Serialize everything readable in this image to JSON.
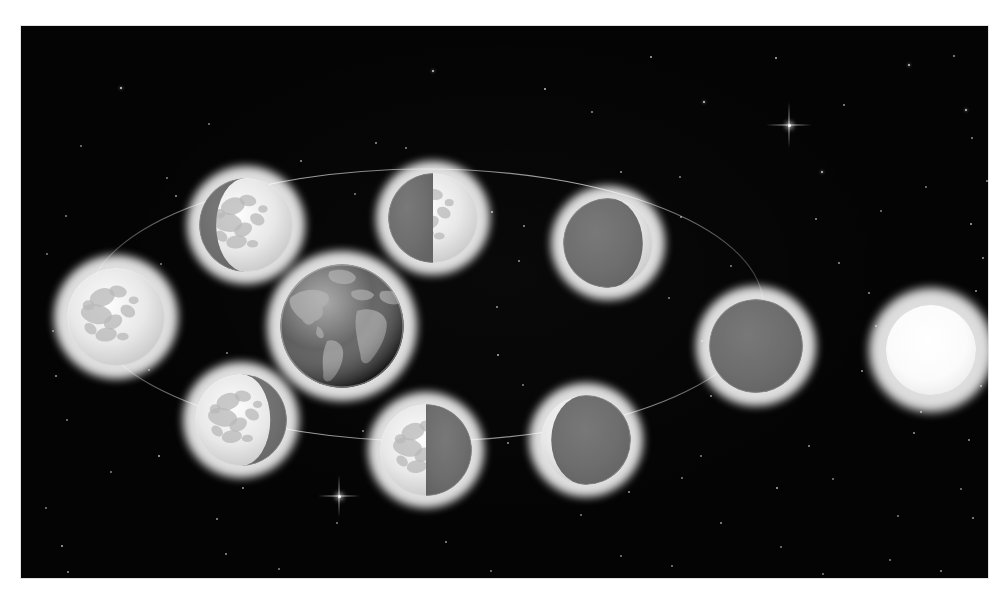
{
  "scene": {
    "title": "Phases of the Moon",
    "description": "Diagram of the lunar phases: the Moon orbiting the Earth with sunlight arriving from the right, shown against a starfield.",
    "canvas": {
      "width": 1003,
      "height": 599
    },
    "plate": {
      "x": 21,
      "y": 26,
      "width": 967,
      "height": 552
    },
    "colors": {
      "sky": "#040404",
      "page": "#ffffff",
      "moon_lit": "#e8e8e8",
      "moon_dark": "#6f6f6f",
      "moon_glow": "#cfcfcf",
      "earth_ocean": "#5a5a5a",
      "earth_land": "#9a9a9a",
      "earth_glow": "#b8b8b8",
      "sun": "#ffffff",
      "sun_glow": "#f2f2f2",
      "orbit_line": "#9a9a9a",
      "star": "#ffffff"
    },
    "orbit": {
      "label": "lunar-orbit-ellipse",
      "center_x": 404,
      "center_y": 279,
      "radius_x": 338,
      "radius_y": 136,
      "stroke_width": 1.1,
      "opacity": 0.55
    }
  },
  "bodies": [
    {
      "name": "full-moon",
      "label": "Full Moon",
      "phase": "full",
      "kind": "moon",
      "x": 95,
      "y": 291,
      "radius": 49,
      "glow_radius": 62,
      "illumination_percent": 100,
      "lit_side": "all"
    },
    {
      "name": "waning-gibbous-moon",
      "label": "Waning Gibbous",
      "phase": "waning-gibbous",
      "kind": "moon",
      "x": 225,
      "y": 199,
      "radius": 47,
      "glow_radius": 59,
      "illumination_percent": 72,
      "lit_side": "right"
    },
    {
      "name": "last-quarter-moon",
      "label": "Last Quarter",
      "phase": "last-quarter",
      "kind": "moon",
      "x": 412,
      "y": 192,
      "radius": 45,
      "glow_radius": 57,
      "illumination_percent": 50,
      "lit_side": "right"
    },
    {
      "name": "waning-crescent-moon",
      "label": "Waning Crescent",
      "phase": "waning-crescent",
      "kind": "moon",
      "x": 587,
      "y": 217,
      "radius": 45,
      "glow_radius": 57,
      "illumination_percent": 22,
      "lit_side": "right"
    },
    {
      "name": "new-moon",
      "label": "New Moon",
      "phase": "new",
      "kind": "moon",
      "x": 735,
      "y": 320,
      "radius": 47,
      "glow_radius": 60,
      "illumination_percent": 0,
      "lit_side": "none"
    },
    {
      "name": "waxing-crescent-moon",
      "label": "Waxing Crescent",
      "phase": "waxing-crescent",
      "kind": "moon",
      "x": 565,
      "y": 414,
      "radius": 45,
      "glow_radius": 57,
      "illumination_percent": 22,
      "lit_side": "left"
    },
    {
      "name": "first-quarter-moon",
      "label": "First Quarter",
      "phase": "first-quarter",
      "kind": "moon",
      "x": 405,
      "y": 424,
      "radius": 46,
      "glow_radius": 58,
      "illumination_percent": 50,
      "lit_side": "left"
    },
    {
      "name": "waxing-gibbous-moon",
      "label": "Waxing Gibbous",
      "phase": "waxing-gibbous",
      "kind": "moon",
      "x": 220,
      "y": 394,
      "radius": 46,
      "glow_radius": 58,
      "illumination_percent": 72,
      "lit_side": "left"
    },
    {
      "name": "earth",
      "label": "Earth",
      "phase": "earth",
      "kind": "earth",
      "x": 321,
      "y": 300,
      "radius": 62,
      "glow_radius": 75,
      "illumination_percent": 100,
      "lit_side": "right"
    },
    {
      "name": "sun",
      "label": "Sun",
      "phase": "sun",
      "kind": "sun",
      "x": 910,
      "y": 324,
      "radius": 45,
      "glow_radius": 62,
      "illumination_percent": 100,
      "lit_side": "all"
    }
  ],
  "sparkles": [
    {
      "name": "sparkle-upper-right",
      "x": 768,
      "y": 99,
      "size": 46
    },
    {
      "name": "sparkle-lower-left",
      "x": 318,
      "y": 470,
      "size": 42
    }
  ],
  "stars": [
    {
      "x": 100,
      "y": 62,
      "r": 1.3,
      "o": 0.85
    },
    {
      "x": 412,
      "y": 45,
      "y2": 0,
      "r": 1.2,
      "o": 0.8
    },
    {
      "x": 630,
      "y": 31,
      "r": 1.0,
      "o": 0.7
    },
    {
      "x": 755,
      "y": 32,
      "r": 1.1,
      "o": 0.75
    },
    {
      "x": 888,
      "y": 39,
      "r": 1.2,
      "o": 0.8
    },
    {
      "x": 933,
      "y": 30,
      "r": 1.0,
      "o": 0.6
    },
    {
      "x": 60,
      "y": 120,
      "r": 0.9,
      "o": 0.5
    },
    {
      "x": 188,
      "y": 98,
      "r": 0.9,
      "o": 0.5
    },
    {
      "x": 355,
      "y": 117,
      "r": 1.0,
      "o": 0.6
    },
    {
      "x": 524,
      "y": 63,
      "r": 1.1,
      "o": 0.75
    },
    {
      "x": 571,
      "y": 86,
      "r": 0.9,
      "o": 0.55
    },
    {
      "x": 683,
      "y": 76,
      "r": 1.2,
      "o": 0.8
    },
    {
      "x": 823,
      "y": 79,
      "r": 1.0,
      "o": 0.6
    },
    {
      "x": 945,
      "y": 84,
      "r": 1.2,
      "o": 0.8
    },
    {
      "x": 951,
      "y": 112,
      "r": 0.9,
      "o": 0.55
    },
    {
      "x": 146,
      "y": 152,
      "r": 0.9,
      "o": 0.5
    },
    {
      "x": 280,
      "y": 135,
      "r": 1.0,
      "o": 0.6
    },
    {
      "x": 385,
      "y": 122,
      "r": 1.0,
      "o": 0.55
    },
    {
      "x": 600,
      "y": 146,
      "r": 1.0,
      "o": 0.6
    },
    {
      "x": 659,
      "y": 151,
      "r": 0.9,
      "o": 0.5
    },
    {
      "x": 801,
      "y": 146,
      "r": 1.2,
      "o": 0.8
    },
    {
      "x": 905,
      "y": 161,
      "r": 0.9,
      "o": 0.5
    },
    {
      "x": 966,
      "y": 155,
      "r": 1.0,
      "o": 0.6
    },
    {
      "x": 45,
      "y": 190,
      "r": 0.9,
      "o": 0.5
    },
    {
      "x": 155,
      "y": 170,
      "r": 1.0,
      "o": 0.6
    },
    {
      "x": 334,
      "y": 168,
      "r": 0.9,
      "o": 0.5
    },
    {
      "x": 471,
      "y": 186,
      "r": 1.1,
      "o": 0.7
    },
    {
      "x": 503,
      "y": 200,
      "r": 1.0,
      "o": 0.6
    },
    {
      "x": 660,
      "y": 191,
      "r": 1.0,
      "o": 0.6
    },
    {
      "x": 795,
      "y": 193,
      "r": 1.0,
      "o": 0.6
    },
    {
      "x": 860,
      "y": 185,
      "r": 0.9,
      "o": 0.5
    },
    {
      "x": 950,
      "y": 198,
      "r": 1.1,
      "o": 0.7
    },
    {
      "x": 26,
      "y": 228,
      "r": 0.9,
      "o": 0.5
    },
    {
      "x": 140,
      "y": 238,
      "r": 0.9,
      "o": 0.5
    },
    {
      "x": 498,
      "y": 235,
      "r": 1.0,
      "o": 0.6
    },
    {
      "x": 710,
      "y": 240,
      "r": 0.9,
      "o": 0.5
    },
    {
      "x": 818,
      "y": 237,
      "r": 1.0,
      "o": 0.6
    },
    {
      "x": 962,
      "y": 232,
      "r": 1.0,
      "o": 0.6
    },
    {
      "x": 60,
      "y": 266,
      "r": 0.9,
      "o": 0.5
    },
    {
      "x": 476,
      "y": 281,
      "r": 1.0,
      "o": 0.6
    },
    {
      "x": 648,
      "y": 272,
      "r": 0.9,
      "o": 0.5
    },
    {
      "x": 848,
      "y": 267,
      "r": 1.0,
      "o": 0.6
    },
    {
      "x": 955,
      "y": 265,
      "r": 1.0,
      "o": 0.6
    },
    {
      "x": 32,
      "y": 305,
      "r": 0.9,
      "o": 0.5
    },
    {
      "x": 477,
      "y": 329,
      "r": 1.1,
      "o": 0.7
    },
    {
      "x": 681,
      "y": 315,
      "r": 0.9,
      "o": 0.5
    },
    {
      "x": 855,
      "y": 300,
      "r": 1.0,
      "o": 0.6
    },
    {
      "x": 945,
      "y": 305,
      "r": 1.0,
      "o": 0.6
    },
    {
      "x": 35,
      "y": 350,
      "r": 1.0,
      "o": 0.6
    },
    {
      "x": 128,
      "y": 344,
      "r": 0.9,
      "o": 0.5
    },
    {
      "x": 206,
      "y": 327,
      "r": 0.9,
      "o": 0.5
    },
    {
      "x": 311,
      "y": 348,
      "r": 1.0,
      "o": 0.6
    },
    {
      "x": 502,
      "y": 359,
      "r": 0.9,
      "o": 0.5
    },
    {
      "x": 690,
      "y": 370,
      "r": 1.0,
      "o": 0.6
    },
    {
      "x": 841,
      "y": 345,
      "r": 1.0,
      "o": 0.6
    },
    {
      "x": 900,
      "y": 386,
      "r": 1.0,
      "o": 0.6
    },
    {
      "x": 960,
      "y": 360,
      "r": 1.0,
      "o": 0.6
    },
    {
      "x": 46,
      "y": 394,
      "r": 0.9,
      "o": 0.5
    },
    {
      "x": 138,
      "y": 430,
      "r": 1.1,
      "o": 0.7
    },
    {
      "x": 342,
      "y": 405,
      "r": 0.9,
      "o": 0.5
    },
    {
      "x": 487,
      "y": 417,
      "r": 1.0,
      "o": 0.6
    },
    {
      "x": 680,
      "y": 430,
      "r": 0.9,
      "o": 0.5
    },
    {
      "x": 788,
      "y": 420,
      "r": 1.0,
      "o": 0.6
    },
    {
      "x": 893,
      "y": 407,
      "r": 1.0,
      "o": 0.6
    },
    {
      "x": 948,
      "y": 414,
      "r": 1.0,
      "o": 0.6
    },
    {
      "x": 90,
      "y": 446,
      "r": 0.9,
      "o": 0.5
    },
    {
      "x": 222,
      "y": 462,
      "r": 1.0,
      "o": 0.6
    },
    {
      "x": 395,
      "y": 452,
      "r": 0.9,
      "o": 0.5
    },
    {
      "x": 608,
      "y": 466,
      "r": 1.0,
      "o": 0.6
    },
    {
      "x": 661,
      "y": 452,
      "r": 0.9,
      "o": 0.5
    },
    {
      "x": 756,
      "y": 462,
      "r": 1.1,
      "o": 0.7
    },
    {
      "x": 812,
      "y": 453,
      "r": 0.9,
      "o": 0.5
    },
    {
      "x": 940,
      "y": 463,
      "r": 0.9,
      "o": 0.5
    },
    {
      "x": 25,
      "y": 482,
      "r": 0.9,
      "o": 0.5
    },
    {
      "x": 196,
      "y": 493,
      "r": 1.0,
      "o": 0.6
    },
    {
      "x": 316,
      "y": 497,
      "r": 0.9,
      "o": 0.5
    },
    {
      "x": 560,
      "y": 489,
      "r": 0.9,
      "o": 0.5
    },
    {
      "x": 700,
      "y": 497,
      "r": 1.0,
      "o": 0.6
    },
    {
      "x": 877,
      "y": 490,
      "r": 0.9,
      "o": 0.5
    },
    {
      "x": 952,
      "y": 492,
      "r": 1.0,
      "o": 0.6
    },
    {
      "x": 41,
      "y": 520,
      "r": 1.1,
      "o": 0.7
    },
    {
      "x": 205,
      "y": 528,
      "r": 1.0,
      "o": 0.6
    },
    {
      "x": 425,
      "y": 516,
      "r": 1.0,
      "o": 0.6
    },
    {
      "x": 600,
      "y": 530,
      "r": 0.9,
      "o": 0.5
    },
    {
      "x": 760,
      "y": 521,
      "r": 0.9,
      "o": 0.5
    },
    {
      "x": 869,
      "y": 534,
      "r": 0.9,
      "o": 0.5
    },
    {
      "x": 47,
      "y": 546,
      "r": 1.0,
      "o": 0.6
    },
    {
      "x": 258,
      "y": 543,
      "r": 0.9,
      "o": 0.5
    },
    {
      "x": 470,
      "y": 545,
      "r": 0.9,
      "o": 0.5
    },
    {
      "x": 651,
      "y": 540,
      "r": 0.9,
      "o": 0.5
    },
    {
      "x": 802,
      "y": 548,
      "r": 0.9,
      "o": 0.5
    },
    {
      "x": 920,
      "y": 545,
      "r": 1.0,
      "o": 0.6
    }
  ]
}
